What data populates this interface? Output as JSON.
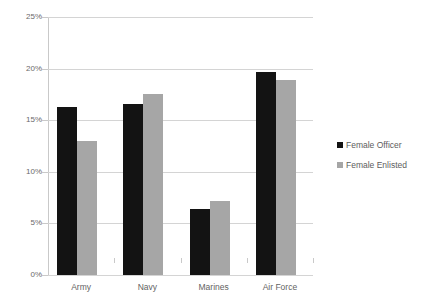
{
  "chart_data": {
    "type": "bar",
    "title": "",
    "xlabel": "",
    "ylabel": "",
    "categories": [
      "Army",
      "Navy",
      "Marines",
      "Air Force"
    ],
    "series": [
      {
        "name": "Female Officer",
        "color": "#131313",
        "values": [
          16.3,
          16.6,
          6.4,
          19.7
        ]
      },
      {
        "name": "Female Enlisted",
        "color": "#a6a6a6",
        "values": [
          13.0,
          17.5,
          7.2,
          18.9
        ]
      }
    ],
    "ylim": [
      0,
      25
    ],
    "yticks": [
      0,
      5,
      10,
      15,
      20,
      25
    ],
    "ytick_labels": [
      "0%",
      "5%",
      "10%",
      "15%",
      "20%",
      "25%"
    ],
    "grid": true,
    "legend_position": "right"
  },
  "legend": {
    "entries": [
      {
        "label": "Female Officer"
      },
      {
        "label": "Female Enlisted"
      }
    ]
  }
}
